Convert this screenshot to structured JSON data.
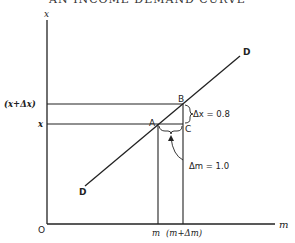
{
  "title": "AN INCOME DEMAND CURVE",
  "axes": {
    "y_label": "x",
    "x_label": "m",
    "origin_label": "O"
  },
  "ticks": {
    "y": [
      "(x+Δx)",
      "x"
    ],
    "x": [
      "m",
      "(m+Δm)"
    ]
  },
  "points": {
    "a": "A",
    "b": "B",
    "c": "C"
  },
  "curve": {
    "label_top": "D",
    "label_bottom": "D"
  },
  "annotations": {
    "delta_x": "Δx = 0.8",
    "delta_m": "Δm = 1.0"
  },
  "colors": {
    "ink": "#222222",
    "background": "#ffffff"
  }
}
